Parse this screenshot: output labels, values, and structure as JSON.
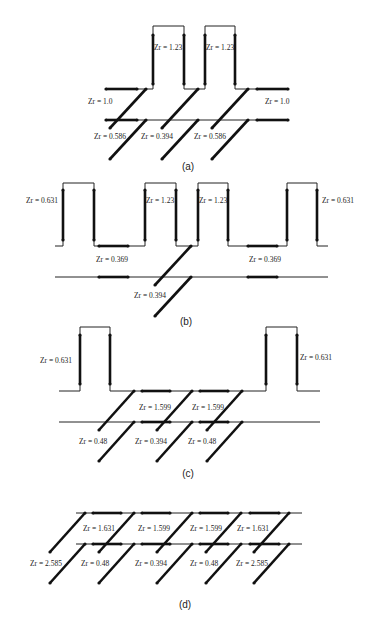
{
  "figure": {
    "panels": [
      {
        "id": "a",
        "caption": "(a)",
        "labels": [
          "Zr = 1.23",
          "Zr = 1.23",
          "Zr = 1.0",
          "Zr = 1.0",
          "Zr = 0.586",
          "Zr = 0.394",
          "Zr = 0.586"
        ]
      },
      {
        "id": "b",
        "caption": "(b)",
        "labels": [
          "Zr = 0.631",
          "Zr = 1.23",
          "Zr = 1.23",
          "Zr = 0.631",
          "Zr = 0.369",
          "Zr = 0.369",
          "Zr = 0.394"
        ]
      },
      {
        "id": "c",
        "caption": "(c)",
        "labels": [
          "Zr = 0.631",
          "Zr = 0.631",
          "Zr = 1.599",
          "Zr = 1.599",
          "Zr = 0.48",
          "Zr = 0.394",
          "Zr = 0.48"
        ]
      },
      {
        "id": "d",
        "caption": "(d)",
        "labels": [
          "Zr = 1.631",
          "Zr = 1.599",
          "Zr = 1.599",
          "Zr = 1.631",
          "Zr = 2.585",
          "Zr = 0.48",
          "Zr = 0.394",
          "Zr = 0.48",
          "Zr = 2.585"
        ]
      }
    ]
  }
}
